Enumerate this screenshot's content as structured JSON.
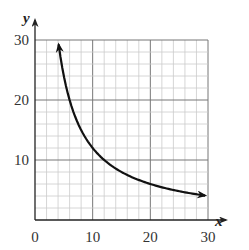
{
  "chart_data": {
    "type": "line",
    "title": "",
    "xlabel": "x",
    "ylabel": "y",
    "xlim": [
      0,
      30
    ],
    "ylim": [
      0,
      30
    ],
    "grid": true,
    "grid_minor_step": 2,
    "grid_major_step": 10,
    "xticks": [
      0,
      10,
      20,
      30
    ],
    "yticks": [
      10,
      20,
      30
    ],
    "xtick_labels": [
      "0",
      "10",
      "20",
      "30"
    ],
    "ytick_labels": [
      "10",
      "20",
      "30"
    ],
    "series": [
      {
        "name": "curve",
        "function": "y = 120/x",
        "x_start": 4.1,
        "x_end": 29.5,
        "arrow_both_ends": true,
        "points": [
          [
            4.1,
            29.3
          ],
          [
            5,
            24
          ],
          [
            6,
            20
          ],
          [
            8,
            15
          ],
          [
            10,
            12
          ],
          [
            12,
            10
          ],
          [
            15,
            8
          ],
          [
            20,
            6
          ],
          [
            24,
            5
          ],
          [
            29.5,
            4.1
          ]
        ]
      }
    ],
    "colors": {
      "curve": "#111111",
      "grid_minor": "#cccccc",
      "grid_major": "#777777",
      "axes": "#222222"
    }
  }
}
